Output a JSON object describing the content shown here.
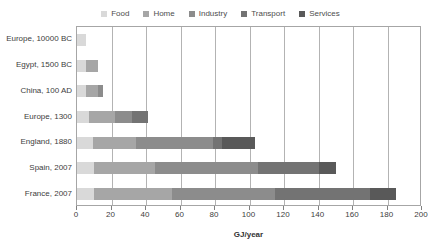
{
  "chart_data": {
    "type": "bar",
    "orientation": "horizontal",
    "stacked": true,
    "title": "",
    "xlabel": "GJ/year",
    "ylabel": "",
    "xlim": [
      0,
      200
    ],
    "xticks": [
      0,
      20,
      40,
      60,
      80,
      100,
      120,
      140,
      160,
      180,
      200
    ],
    "grid": true,
    "legend_position": "top-center",
    "categories": [
      "Europe, 10000 BC",
      "Egypt, 1500 BC",
      "China, 100 AD",
      "Europe, 1300",
      "England, 1880",
      "Spain, 2007",
      "France, 2007"
    ],
    "series": [
      {
        "name": "Food",
        "color": "#d9d9d9",
        "values": [
          5,
          5,
          5,
          7,
          9,
          10,
          10
        ]
      },
      {
        "name": "Home",
        "color": "#a6a6a6",
        "values": [
          0,
          7,
          7,
          15,
          25,
          35,
          45
        ]
      },
      {
        "name": "Industry",
        "color": "#8c8c8c",
        "values": [
          0,
          0,
          3,
          10,
          45,
          60,
          60
        ]
      },
      {
        "name": "Transport",
        "color": "#737373",
        "values": [
          0,
          0,
          0,
          9,
          5,
          35,
          55
        ]
      },
      {
        "name": "Services",
        "color": "#595959",
        "values": [
          0,
          0,
          0,
          0,
          19,
          10,
          15
        ]
      }
    ],
    "totals": [
      5,
      12,
      15,
      41,
      103,
      150,
      185
    ]
  },
  "legend": {
    "items": [
      {
        "label": "Food",
        "color": "#d9d9d9"
      },
      {
        "label": "Home",
        "color": "#a6a6a6"
      },
      {
        "label": "Industry",
        "color": "#8c8c8c"
      },
      {
        "label": "Transport",
        "color": "#737373"
      },
      {
        "label": "Services",
        "color": "#595959"
      }
    ]
  },
  "axis": {
    "x_title": "GJ/year",
    "tick_labels": [
      "0",
      "20",
      "40",
      "60",
      "80",
      "100",
      "120",
      "140",
      "160",
      "180",
      "200"
    ]
  }
}
